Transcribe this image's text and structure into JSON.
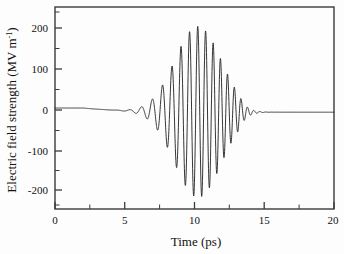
{
  "figure": {
    "background_color": "#fdfdfd",
    "frame_color": "#3a3a3a",
    "curve_color": "#2b2b2b"
  },
  "axes": {
    "x_title": "Time (ps)",
    "y_title_main": "Electric field strength (MV m",
    "y_title_sup": "-1",
    "y_title_close": ")",
    "x_ticks": [
      "0",
      "5",
      "10",
      "15",
      "20"
    ],
    "y_ticks": [
      "200",
      "100",
      "0",
      "-100",
      "-200"
    ]
  },
  "chart_data": {
    "type": "line",
    "title": "",
    "xlabel": "Time (ps)",
    "ylabel": "Electric field strength (MV m^-1)",
    "xlim": [
      0,
      20
    ],
    "ylim": [
      -250,
      250
    ],
    "xticks": [
      0,
      5,
      10,
      15,
      20
    ],
    "yticks": [
      -200,
      -100,
      0,
      100,
      200
    ],
    "xticks_minor_step": 2.5,
    "yticks_minor_step": 50,
    "grid": false,
    "legend": null,
    "series": [
      {
        "name": "Electric field",
        "x": [
          0.0,
          0.5,
          1.0,
          1.5,
          2.0,
          2.5,
          3.0,
          3.2,
          3.5,
          3.8,
          4.05,
          4.3,
          4.6,
          4.9,
          5.1,
          5.35,
          5.6,
          5.85,
          6.1,
          6.35,
          6.6,
          6.9,
          7.2,
          7.5,
          7.8,
          8.1,
          8.4,
          8.7,
          9.0,
          9.3,
          9.6,
          9.9,
          10.2,
          10.45,
          10.7,
          10.95,
          11.2,
          11.45,
          11.7,
          11.95,
          12.2,
          12.4,
          12.6,
          12.85,
          13.05,
          13.25,
          13.45,
          13.65,
          13.85,
          14.05,
          14.25,
          14.45,
          14.65,
          14.9,
          15.1,
          15.35,
          15.6,
          15.9,
          16.2,
          16.6,
          17.0,
          17.5,
          18.0,
          18.5,
          19.0,
          19.5,
          20.0
        ],
        "y": [
          0,
          0,
          0,
          -1,
          -2,
          -3,
          -6,
          2,
          -9,
          4,
          -12,
          7,
          -17,
          12,
          27,
          -24,
          40,
          -33,
          57,
          -43,
          66,
          -50,
          -118,
          -40,
          165,
          -60,
          -205,
          70,
          207,
          -220,
          203,
          -215,
          190,
          -200,
          172,
          -180,
          150,
          -158,
          125,
          -132,
          100,
          -105,
          78,
          -82,
          60,
          -62,
          44,
          -46,
          31,
          -33,
          22,
          -24,
          15,
          -17,
          10,
          -12,
          7,
          -10,
          -6,
          -9,
          -8,
          -9,
          -9,
          -10,
          -10,
          -10,
          -11
        ]
      }
    ]
  }
}
